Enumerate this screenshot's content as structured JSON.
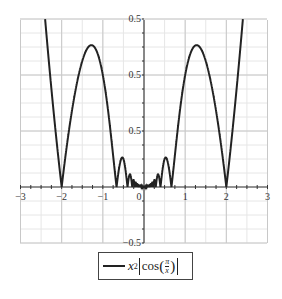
{
  "chart_data": {
    "type": "line",
    "title": "",
    "xlabel": "",
    "ylabel": "",
    "function": "x^2*|cos(pi/x)|",
    "xlim": [
      -3,
      3
    ],
    "ylim": [
      -0.5,
      1.5
    ],
    "grid": true,
    "legend_position": "bottom",
    "x_ticks": [
      -3,
      -2,
      -1,
      0,
      1,
      2,
      3
    ],
    "x_tick_labels": [
      "−3",
      "−2",
      "−1",
      "0",
      "1",
      "2",
      "3"
    ],
    "y_ticks": [
      1.5,
      1.0,
      0.5,
      -0.5
    ],
    "y_tick_labels": [
      "0.5",
      "0.5",
      "0.5",
      "−0.5"
    ],
    "series": [
      {
        "name": "x²|cos(π/x)|",
        "color": "#222222",
        "x": [
          -2.4,
          -2.0,
          -1.3,
          -0.67,
          -0.5,
          -0.4,
          -0.29,
          0,
          0.29,
          0.4,
          0.5,
          0.67,
          1.3,
          2.0,
          2.4
        ],
        "values": [
          1.45,
          0.0,
          1.27,
          0.0,
          0.25,
          0.0,
          0.05,
          0.0,
          0.05,
          0.0,
          0.25,
          0.0,
          1.27,
          0.0,
          1.45
        ]
      }
    ]
  },
  "legend": {
    "prefix": "x",
    "exponent": "2",
    "func": "cos",
    "num": "π",
    "den": "x"
  }
}
